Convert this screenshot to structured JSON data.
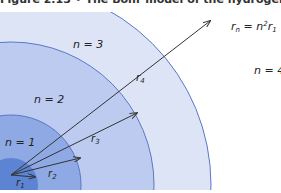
{
  "caption": "Figure 2.13  •  The Bohr model of the hydrogen atom",
  "formula": "r_n = n^2 r_1",
  "orbits": [
    {
      "n": "n = 1",
      "radius_label": "r1",
      "color": "#5b82d0"
    },
    {
      "n": "n = 2",
      "radius_label": "r2",
      "color": "#8aa6e0"
    },
    {
      "n": "n = 3",
      "radius_label": "r3",
      "color": "#b3c4ec"
    },
    {
      "n": "n = 4",
      "radius_label": "r4",
      "color": "#d9e1f6"
    }
  ],
  "colors": {
    "line": "#4a68b8",
    "arrow": "#333333",
    "background": "#ffffff"
  }
}
